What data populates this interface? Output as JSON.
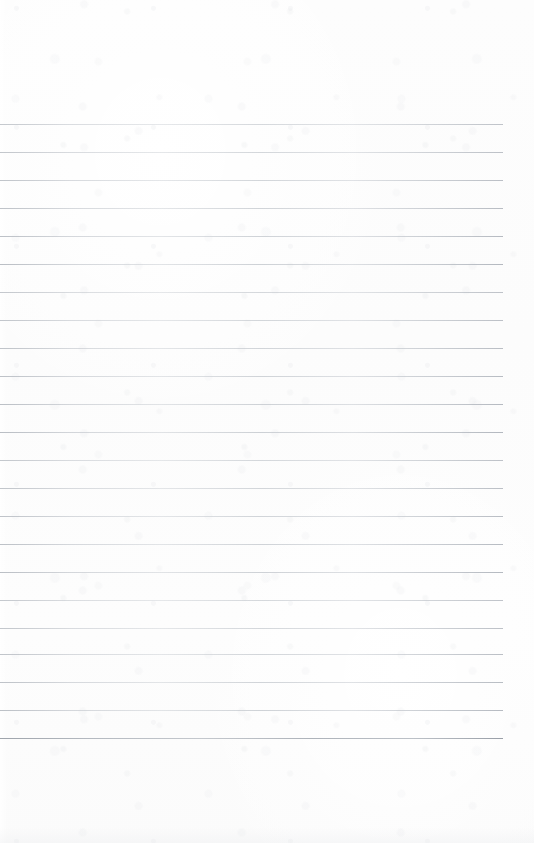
{
  "page": {
    "kind": "scanned-ruled-notebook-page",
    "width": 534,
    "height": 843,
    "paper_color": "#fdfdfd",
    "has_text": false,
    "written_content": [],
    "headings": [],
    "margin_top_px": 124,
    "margin_bottom_px": 105
  },
  "ruling": {
    "line_color": "#c4c8cc",
    "line_color_dark": "#9aa0a8",
    "line_thickness_px": 1,
    "line_spacing_px": 28,
    "first_line_y": 124,
    "last_line_y": 738,
    "line_count": 23,
    "line_start_x": 0,
    "line_end_x": 503,
    "lines": [
      {
        "y": 124,
        "weight": "normal"
      },
      {
        "y": 152,
        "weight": "normal"
      },
      {
        "y": 180,
        "weight": "normal"
      },
      {
        "y": 208,
        "weight": "normal"
      },
      {
        "y": 236,
        "weight": "normal"
      },
      {
        "y": 264,
        "weight": "normal"
      },
      {
        "y": 292,
        "weight": "normal"
      },
      {
        "y": 320,
        "weight": "normal"
      },
      {
        "y": 348,
        "weight": "normal"
      },
      {
        "y": 376,
        "weight": "normal"
      },
      {
        "y": 404,
        "weight": "normal"
      },
      {
        "y": 432,
        "weight": "normal"
      },
      {
        "y": 460,
        "weight": "normal"
      },
      {
        "y": 488,
        "weight": "normal"
      },
      {
        "y": 516,
        "weight": "normal"
      },
      {
        "y": 544,
        "weight": "normal"
      },
      {
        "y": 572,
        "weight": "normal"
      },
      {
        "y": 600,
        "weight": "normal"
      },
      {
        "y": 628,
        "weight": "normal"
      },
      {
        "y": 654,
        "weight": "normal"
      },
      {
        "y": 682,
        "weight": "normal"
      },
      {
        "y": 710,
        "weight": "normal"
      },
      {
        "y": 738,
        "weight": "heavy"
      }
    ]
  }
}
